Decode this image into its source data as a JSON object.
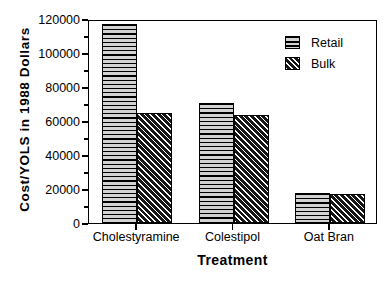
{
  "chart_data": {
    "type": "bar",
    "title": "",
    "subtitle": "",
    "xlabel": "Treatment",
    "ylabel": "Cost/YOLS in 1988 Dollars",
    "categories": [
      "Cholestyramine",
      "Colestipol",
      "Oat Bran"
    ],
    "series": [
      {
        "name": "Retail",
        "values": [
          117000,
          70500,
          17500
        ],
        "pattern": "horizontal-lines"
      },
      {
        "name": "Bulk",
        "values": [
          64500,
          63500,
          16800
        ],
        "pattern": "diagonal-hatch"
      }
    ],
    "ylim": [
      0,
      120000
    ],
    "yticks": [
      0,
      20000,
      40000,
      60000,
      80000,
      100000,
      120000
    ],
    "ytick_labels": [
      "0",
      "20000",
      "40000",
      "60000",
      "80000",
      "100000",
      "120000"
    ],
    "yminor_ticks": [
      10000,
      30000,
      50000,
      70000,
      90000,
      110000
    ],
    "grid": false,
    "legend_position": "top-right",
    "frame": "box",
    "colors": {
      "axis": "#000000",
      "background": "#ffffff",
      "retail_fill": "#c8c8c8",
      "bulk_fill": "#2b2b2b"
    }
  },
  "legend": {
    "entries": [
      {
        "label": "Retail"
      },
      {
        "label": "Bulk"
      }
    ]
  }
}
